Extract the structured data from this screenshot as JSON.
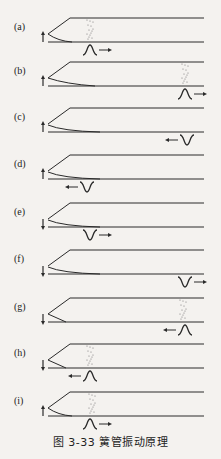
{
  "figure": {
    "caption": "图 3-33   簧管振动原理",
    "colors": {
      "line": "#2a2a2a",
      "background": "#f4f2ef",
      "dots": "#777777"
    },
    "panels": [
      {
        "label": "(a)",
        "reed_arrow": "up",
        "reed": "bent",
        "pulse": "crest",
        "pulse_x": 90,
        "direction": "right",
        "dots_x": 90
      },
      {
        "label": "(b)",
        "reed_arrow": "up",
        "reed": "down",
        "pulse": "crest",
        "pulse_x": 185,
        "direction": "right",
        "dots_x": 185
      },
      {
        "label": "(c)",
        "reed_arrow": "up",
        "reed": "closed",
        "pulse": "trough",
        "pulse_x": 187,
        "direction": "left",
        "dots_x": null
      },
      {
        "label": "(d)",
        "reed_arrow": "up",
        "reed": "closed",
        "pulse": "trough",
        "pulse_x": 87,
        "direction": "left",
        "dots_x": null
      },
      {
        "label": "(e)",
        "reed_arrow": "down",
        "reed": "closed",
        "pulse": "trough",
        "pulse_x": 90,
        "direction": "right",
        "dots_x": null
      },
      {
        "label": "(f)",
        "reed_arrow": "down",
        "reed": "closed",
        "pulse": "trough",
        "pulse_x": 185,
        "direction": "right",
        "dots_x": null
      },
      {
        "label": "(g)",
        "reed_arrow": "down",
        "reed": "open",
        "pulse": "crest",
        "pulse_x": 185,
        "direction": "left",
        "dots_x": 183
      },
      {
        "label": "(h)",
        "reed_arrow": "down",
        "reed": "open",
        "pulse": "crest",
        "pulse_x": 90,
        "direction": "left",
        "dots_x": 90
      },
      {
        "label": "(i)",
        "reed_arrow": "up",
        "reed": "bent",
        "pulse": "crest",
        "pulse_x": 90,
        "direction": "right",
        "dots_x": 92
      }
    ]
  }
}
